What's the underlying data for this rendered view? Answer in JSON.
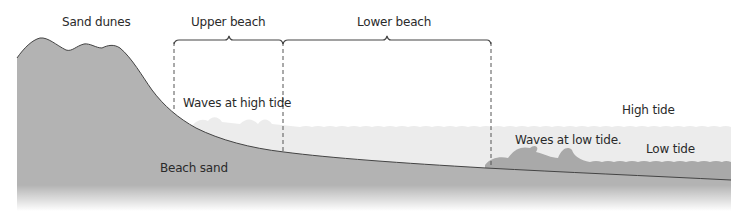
{
  "diagram": {
    "type": "beach-profile-cross-section",
    "labels": {
      "sand_dunes": "Sand dunes",
      "upper_beach": "Upper beach",
      "lower_beach": "Lower beach",
      "waves_high_tide": "Waves at high tide",
      "high_tide": "High tide",
      "waves_low_tide": "Waves at low tide.",
      "low_tide": "Low tide",
      "beach_sand": "Beach sand"
    },
    "colors": {
      "sand": "#b3b3b3",
      "sand_outline": "#444444",
      "water_high": "#ececec",
      "water_low": "#d4d4d4",
      "low_wave": "#a9a9a9",
      "bracket": "#444444",
      "divider": "#555555",
      "text": "#2a2a2a"
    }
  }
}
